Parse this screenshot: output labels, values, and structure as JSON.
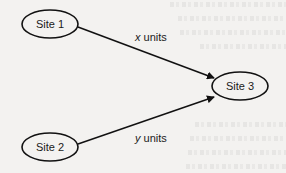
{
  "diagram": {
    "type": "network-flow",
    "colors": {
      "background": "#f3f2f0",
      "stroke": "#111111",
      "node_fill": "#f3f2f0",
      "text": "#1a1a1a"
    },
    "nodes": [
      {
        "id": "site1",
        "label": "Site 1",
        "cx": 50,
        "cy": 24,
        "rx": 28,
        "ry": 14
      },
      {
        "id": "site2",
        "label": "Site 2",
        "cx": 50,
        "cy": 147,
        "rx": 28,
        "ry": 14
      },
      {
        "id": "site3",
        "label": "Site 3",
        "cx": 240,
        "cy": 86,
        "rx": 28,
        "ry": 14
      }
    ],
    "edges": [
      {
        "from": "site1",
        "to": "site3",
        "variable": "x",
        "unit_text": " units",
        "label": "x units"
      },
      {
        "from": "site2",
        "to": "site3",
        "variable": "y",
        "unit_text": " units",
        "label": "y units"
      }
    ]
  }
}
